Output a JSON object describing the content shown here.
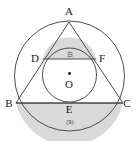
{
  "figure": {
    "canvas": {
      "width": 138,
      "height": 141,
      "background": "#ffffff"
    },
    "colors": {
      "stroke": "#3a3a3a",
      "shade_fill": "#d9d9d9",
      "label_text": "#1a1a1a",
      "region_text": "#4a4a4a",
      "center_dot": "#000000"
    },
    "outer_circle": {
      "cx": 69.5,
      "cy": 76.0,
      "r": 55.0,
      "name": "circumcircle"
    },
    "inner_circle": {
      "cx": 69.5,
      "cy": 75.0,
      "r": 27.0,
      "name": "incircle"
    },
    "triangle": {
      "name": "triangle-ABC",
      "points": "69,22 16,103 123,103"
    },
    "chord_DF": {
      "x1": 43.0,
      "y1": 59.0,
      "x2": 96.0,
      "y2": 59.0
    },
    "chord_BC": {
      "x1": 16.0,
      "y1": 103.0,
      "x2": 123.0,
      "y2": 103.0
    },
    "shaded_segment_top": {
      "name": "shaded-segment-DF",
      "path": "M 43,59 A 27,27 0 0 1 96,59 Z"
    },
    "shaded_segment_bottom": {
      "name": "shaded-segment-BC",
      "path": "M 16,103 A 55,55 0 0 0 123,103 Z"
    },
    "center_dot": {
      "cx": 69.5,
      "cy": 73.5,
      "r": 1.4
    },
    "vertex_labels": [
      {
        "id": "A",
        "text": "A",
        "x": 69,
        "y": 6
      },
      {
        "id": "D",
        "text": "D",
        "x": 34,
        "y": 53
      },
      {
        "id": "F",
        "text": "F",
        "x": 99,
        "y": 53
      },
      {
        "id": "O",
        "text": "O",
        "x": 69,
        "y": 79
      },
      {
        "id": "B",
        "text": "B",
        "x": 8,
        "y": 99
      },
      {
        "id": "C",
        "text": "C",
        "x": 124,
        "y": 99
      },
      {
        "id": "E",
        "text": "E",
        "x": 69,
        "y": 104
      }
    ],
    "region_labels": [
      {
        "id": "top-segment",
        "text": "白",
        "x": 69,
        "y": 52
      },
      {
        "id": "bottom-segment",
        "text": "(9)",
        "x": 69,
        "y": 120
      }
    ]
  }
}
